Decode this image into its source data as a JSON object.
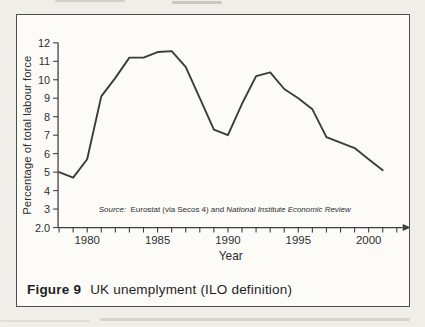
{
  "page": {
    "background": "#f0eee8"
  },
  "figure": {
    "caption_label": "Figure 9",
    "caption_text": "UK unemplyment (ILO definition)",
    "border_color": "#4e4e4e"
  },
  "chart_data": {
    "type": "line",
    "title": "",
    "xlabel": "Year",
    "ylabel": "Percentage of total labour force",
    "source_note": {
      "prefix_italic": "Source:",
      "middle_regular": "  Eurostat (via Secos 4) and ",
      "suffix_italic": "National Institute Economic Review"
    },
    "x": [
      1978,
      1979,
      1980,
      1981,
      1982,
      1983,
      1984,
      1985,
      1986,
      1987,
      1988,
      1989,
      1990,
      1991,
      1992,
      1993,
      1994,
      1995,
      1996,
      1997,
      1998,
      1999,
      2000,
      2001
    ],
    "values": [
      5.0,
      4.7,
      5.7,
      9.1,
      10.1,
      11.2,
      11.2,
      11.5,
      11.55,
      10.7,
      9.0,
      7.3,
      7.0,
      8.7,
      10.2,
      10.4,
      9.5,
      9.0,
      8.4,
      6.9,
      6.6,
      6.3,
      5.7,
      5.1
    ],
    "ylim": [
      2,
      12
    ],
    "xlim": [
      1978,
      2002
    ],
    "ytick_values": [
      2,
      3,
      4,
      5,
      6,
      7,
      8,
      9,
      10,
      11,
      12
    ],
    "ytick_labels": [
      "2.0",
      "3",
      "4",
      "5",
      "6",
      "7",
      "8",
      "9",
      "10",
      "11",
      "12"
    ],
    "xticks_minor_years": [
      1978,
      1979,
      1980,
      1981,
      1982,
      1983,
      1984,
      1985,
      1986,
      1987,
      1988,
      1989,
      1990,
      1991,
      1992,
      1993,
      1994,
      1995,
      1996,
      1997,
      1998,
      1999,
      2000,
      2001,
      2002
    ],
    "xtick_labeled": [
      1980,
      1985,
      1990,
      1995,
      2000
    ],
    "grid": false,
    "legend": "none",
    "line_color": "#3b3b3b",
    "axis_color": "#3f3f3f"
  }
}
